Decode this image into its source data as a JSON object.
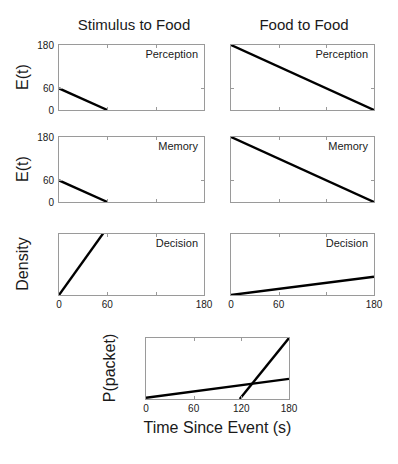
{
  "figure": {
    "width": 398,
    "height": 464,
    "background": "#ffffff",
    "line_color": "#000000",
    "axis_color": "#9a9a9a"
  },
  "columns": [
    {
      "id": "stimulus-to-food",
      "title": "Stimulus to Food"
    },
    {
      "id": "food-to-food",
      "title": "Food to Food"
    }
  ],
  "axis_labels": {
    "row1_y": "E(t)",
    "row2_y": "E(t)",
    "row3_y": "Density",
    "row4_y": "P(packet)",
    "x": "Time Since Event (s)"
  },
  "panel_labels": {
    "perception": "Perception",
    "memory": "Memory",
    "decision": "Decision"
  },
  "ticks": {
    "x_labels_main": [
      "0",
      "60",
      "180"
    ],
    "x_values_main": [
      0,
      60,
      180
    ],
    "x_gridticks_main": [
      0,
      60,
      120,
      180
    ],
    "x_labels_bottom": [
      "0",
      "60",
      "120",
      "180"
    ],
    "x_values_bottom": [
      0,
      60,
      120,
      180
    ],
    "y_labels_et": [
      "180",
      "60",
      "0"
    ],
    "y_values_et": [
      180,
      60,
      0
    ]
  },
  "chart_data": {
    "type": "line",
    "title": "",
    "xlabel": "Time Since Event (s)",
    "xlim": [
      0,
      180
    ],
    "grid": false,
    "legend": "none",
    "panels": [
      {
        "name": "perception-stimulus-to-food",
        "row": 1,
        "column": "Stimulus to Food",
        "annotation": "Perception",
        "ylabel": "E(t)",
        "ylim": [
          0,
          180
        ],
        "yticks": [
          0,
          60,
          180
        ],
        "yticklabels": [
          "0",
          "60",
          "180"
        ],
        "xticks": [
          0,
          60,
          180
        ],
        "xticklabels": [
          "0",
          "60",
          "180"
        ],
        "series": [
          {
            "name": "perception-decay",
            "x": [
              0,
              60
            ],
            "y": [
              60,
              0
            ]
          }
        ]
      },
      {
        "name": "perception-food-to-food",
        "row": 1,
        "column": "Food to Food",
        "annotation": "Perception",
        "ylabel": "",
        "ylim": [
          0,
          180
        ],
        "yticks": [
          0,
          60,
          180
        ],
        "yticklabels": [],
        "xticks": [
          0,
          60,
          180
        ],
        "xticklabels": [
          "0",
          "60",
          "180"
        ],
        "series": [
          {
            "name": "perception-decay",
            "x": [
              0,
              180
            ],
            "y": [
              180,
              0
            ]
          }
        ]
      },
      {
        "name": "memory-stimulus-to-food",
        "row": 2,
        "column": "Stimulus to Food",
        "annotation": "Memory",
        "ylabel": "E(t)",
        "ylim": [
          0,
          180
        ],
        "yticks": [
          0,
          60,
          180
        ],
        "yticklabels": [
          "0",
          "60",
          "180"
        ],
        "xticks": [
          0,
          60,
          180
        ],
        "xticklabels": [
          "0",
          "60",
          "180"
        ],
        "series": [
          {
            "name": "memory-decay",
            "x": [
              0,
              60
            ],
            "y": [
              60,
              0
            ]
          }
        ]
      },
      {
        "name": "memory-food-to-food",
        "row": 2,
        "column": "Food to Food",
        "annotation": "Memory",
        "ylabel": "",
        "ylim": [
          0,
          180
        ],
        "yticks": [
          0,
          60,
          180
        ],
        "yticklabels": [],
        "xticks": [
          0,
          60,
          180
        ],
        "xticklabels": [
          "0",
          "60",
          "180"
        ],
        "series": [
          {
            "name": "memory-decay",
            "x": [
              0,
              180
            ],
            "y": [
              180,
              0
            ]
          }
        ]
      },
      {
        "name": "decision-stimulus-to-food",
        "row": 3,
        "column": "Stimulus to Food",
        "annotation": "Decision",
        "ylabel": "Density",
        "ylim": [
          0,
          1
        ],
        "yticks": [],
        "yticklabels": [],
        "xticks": [
          0,
          60,
          180
        ],
        "xticklabels": [
          "0",
          "60",
          "180"
        ],
        "series": [
          {
            "name": "decision-rise",
            "x": [
              0,
              57
            ],
            "y": [
              0,
              1.05
            ]
          }
        ]
      },
      {
        "name": "decision-food-to-food",
        "row": 3,
        "column": "Food to Food",
        "annotation": "Decision",
        "ylabel": "",
        "ylim": [
          0,
          1
        ],
        "yticks": [],
        "yticklabels": [],
        "xticks": [
          0,
          60,
          180
        ],
        "xticklabels": [
          "0",
          "60",
          "180"
        ],
        "series": [
          {
            "name": "decision-rise",
            "x": [
              0,
              180
            ],
            "y": [
              0,
              0.3
            ]
          }
        ]
      },
      {
        "name": "packet-probability",
        "row": 4,
        "column": "",
        "annotation": "",
        "ylabel": "P(packet)",
        "ylim": [
          0,
          1
        ],
        "yticks": [],
        "yticklabels": [],
        "xticks": [
          0,
          60,
          120,
          180
        ],
        "xticklabels": [
          "0",
          "60",
          "120",
          "180"
        ],
        "series": [
          {
            "name": "shallow-rise",
            "x": [
              0,
              180
            ],
            "y": [
              0.02,
              0.33
            ]
          },
          {
            "name": "steep-rise",
            "x": [
              118,
              180
            ],
            "y": [
              0,
              1.0
            ]
          }
        ]
      }
    ]
  }
}
